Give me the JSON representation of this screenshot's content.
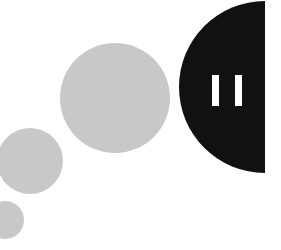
{
  "canvas": {
    "width": 281,
    "height": 250,
    "background_color": "#ffffff",
    "description": "Abstract pause-button graphic with trailing dots"
  },
  "palette": {
    "background": "#ffffff",
    "accent_dark": "#111111",
    "dot_gray": "#c8c8c8",
    "bar_white": "#ffffff"
  },
  "pause_button": {
    "icon_name": "pause-icon",
    "shape": "half-disc",
    "fill": "#111111",
    "center_x": 265,
    "center_y": 87,
    "radius": 86,
    "flat_edge": "right",
    "bars": [
      {
        "label": "pause-bar-left",
        "x": 212,
        "y": 75,
        "width": 7,
        "height": 31,
        "fill": "#ffffff"
      },
      {
        "label": "pause-bar-right",
        "x": 235,
        "y": 75,
        "width": 7,
        "height": 31,
        "fill": "#ffffff"
      }
    ]
  },
  "trail_dots": [
    {
      "label": "dot-large",
      "cx": 115,
      "cy": 98,
      "r": 55,
      "fill": "#c8c8c8"
    },
    {
      "label": "dot-medium",
      "cx": 30,
      "cy": 161,
      "r": 33,
      "fill": "#c8c8c8"
    },
    {
      "label": "dot-small",
      "cx": 5,
      "cy": 220,
      "r": 19,
      "fill": "#c8c8c8"
    }
  ]
}
